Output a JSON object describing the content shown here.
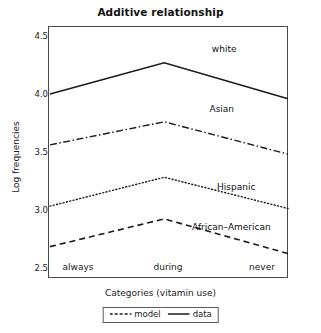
{
  "chart_data": {
    "type": "line",
    "title": "Additive relationship",
    "xlabel": "Categories (vitamin use)",
    "ylabel": "Log frequencies",
    "categories": [
      "always",
      "during",
      "never"
    ],
    "ylim": [
      2.42,
      4.6
    ],
    "yticks": [
      2.5,
      3.0,
      3.5,
      4.0,
      4.5
    ],
    "ytick_labels": [
      "2.5",
      "3.0",
      "3.5",
      "4.0",
      "4.5"
    ],
    "grid": false,
    "legend_position": "below-axis",
    "legend": [
      {
        "label": "model",
        "style": "dashed"
      },
      {
        "label": "data",
        "style": "solid"
      }
    ],
    "series": [
      {
        "name": "white",
        "style": "solid",
        "values": [
          4.02,
          4.29,
          3.98
        ],
        "annotation": "white"
      },
      {
        "name": "Asian",
        "style": "dashdot",
        "values": [
          3.58,
          3.78,
          3.5
        ],
        "annotation": "Asian"
      },
      {
        "name": "Hispanic",
        "style": "dotted",
        "values": [
          3.05,
          3.3,
          3.03
        ],
        "annotation": "Hispanic"
      },
      {
        "name": "African-American",
        "style": "dashed",
        "values": [
          2.7,
          2.94,
          2.64
        ],
        "annotation": "African–American"
      }
    ],
    "annotations": [
      {
        "text": "white",
        "x": 0.73,
        "y": 4.4
      },
      {
        "text": "Asian",
        "x": 0.72,
        "y": 3.88
      },
      {
        "text": "Hispanic",
        "x": 0.78,
        "y": 3.21
      },
      {
        "text": "African–American",
        "x": 0.76,
        "y": 2.86
      }
    ],
    "colors": {
      "line": "#1a1a1a",
      "frame": "#4a4a4a",
      "background": "#ffffff",
      "text": "#1a1a1a"
    }
  }
}
